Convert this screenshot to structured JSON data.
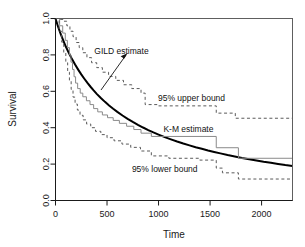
{
  "chart_data": {
    "type": "line",
    "title": "",
    "xlabel": "Time",
    "ylabel": "Survival",
    "xlim": [
      0,
      2300
    ],
    "ylim": [
      0.0,
      1.0
    ],
    "xticks": [
      0,
      500,
      1000,
      1500,
      2000
    ],
    "xticklabels": [
      "0",
      "500",
      "1000",
      "1500",
      "2000"
    ],
    "yticks": [
      0.0,
      0.2,
      0.4,
      0.6,
      0.8,
      1.0
    ],
    "yticklabels": [
      "0.0",
      "0.2",
      "0.4",
      "0.6",
      "0.8",
      "1.0"
    ],
    "grid": false,
    "legend": "none",
    "annotations": [
      {
        "name": "gild-estimate-label",
        "text": "GILD estimate",
        "x": 640,
        "y": 0.805
      },
      {
        "name": "upper-bound-label",
        "text": "95% upper bound",
        "x": 1320,
        "y": 0.545
      },
      {
        "name": "km-estimate-label",
        "text": "K-M estimate",
        "x": 1290,
        "y": 0.375
      },
      {
        "name": "lower-bound-label",
        "text": "95% lower bound",
        "x": 1060,
        "y": 0.155
      }
    ],
    "series": [
      {
        "name": "GILD estimate",
        "style": "solid",
        "color": "#000000",
        "width": 2.0,
        "points": [
          [
            0,
            1.0
          ],
          [
            25,
            0.955
          ],
          [
            50,
            0.915
          ],
          [
            75,
            0.88
          ],
          [
            100,
            0.846
          ],
          [
            130,
            0.81
          ],
          [
            160,
            0.777
          ],
          [
            190,
            0.747
          ],
          [
            220,
            0.719
          ],
          [
            250,
            0.693
          ],
          [
            280,
            0.669
          ],
          [
            310,
            0.646
          ],
          [
            340,
            0.625
          ],
          [
            370,
            0.605
          ],
          [
            400,
            0.586
          ],
          [
            440,
            0.563
          ],
          [
            480,
            0.542
          ],
          [
            520,
            0.522
          ],
          [
            560,
            0.504
          ],
          [
            600,
            0.487
          ],
          [
            650,
            0.467
          ],
          [
            700,
            0.449
          ],
          [
            750,
            0.432
          ],
          [
            800,
            0.416
          ],
          [
            850,
            0.401
          ],
          [
            900,
            0.387
          ],
          [
            950,
            0.374
          ],
          [
            1000,
            0.362
          ],
          [
            1060,
            0.348
          ],
          [
            1120,
            0.336
          ],
          [
            1180,
            0.324
          ],
          [
            1240,
            0.313
          ],
          [
            1300,
            0.303
          ],
          [
            1360,
            0.293
          ],
          [
            1420,
            0.284
          ],
          [
            1480,
            0.275
          ],
          [
            1540,
            0.267
          ],
          [
            1600,
            0.259
          ],
          [
            1670,
            0.25
          ],
          [
            1740,
            0.242
          ],
          [
            1810,
            0.234
          ],
          [
            1880,
            0.227
          ],
          [
            1950,
            0.22
          ],
          [
            2020,
            0.213
          ],
          [
            2090,
            0.207
          ],
          [
            2160,
            0.201
          ],
          [
            2230,
            0.195
          ],
          [
            2300,
            0.19
          ]
        ]
      },
      {
        "name": "K-M estimate",
        "style": "step",
        "color": "#8a8a8a",
        "width": 1.0,
        "points": [
          [
            0,
            1.0
          ],
          [
            40,
            1.0
          ],
          [
            40,
            0.96
          ],
          [
            70,
            0.96
          ],
          [
            70,
            0.92
          ],
          [
            95,
            0.92
          ],
          [
            95,
            0.88
          ],
          [
            115,
            0.88
          ],
          [
            115,
            0.84
          ],
          [
            135,
            0.84
          ],
          [
            135,
            0.8
          ],
          [
            150,
            0.8
          ],
          [
            150,
            0.76
          ],
          [
            165,
            0.76
          ],
          [
            165,
            0.72
          ],
          [
            180,
            0.72
          ],
          [
            180,
            0.68
          ],
          [
            195,
            0.68
          ],
          [
            195,
            0.645
          ],
          [
            215,
            0.645
          ],
          [
            215,
            0.615
          ],
          [
            240,
            0.615
          ],
          [
            240,
            0.59
          ],
          [
            265,
            0.59
          ],
          [
            265,
            0.57
          ],
          [
            300,
            0.57
          ],
          [
            300,
            0.548
          ],
          [
            335,
            0.548
          ],
          [
            335,
            0.527
          ],
          [
            370,
            0.527
          ],
          [
            370,
            0.505
          ],
          [
            410,
            0.505
          ],
          [
            410,
            0.487
          ],
          [
            455,
            0.487
          ],
          [
            455,
            0.47
          ],
          [
            505,
            0.47
          ],
          [
            505,
            0.455
          ],
          [
            560,
            0.455
          ],
          [
            560,
            0.44
          ],
          [
            620,
            0.44
          ],
          [
            620,
            0.424
          ],
          [
            690,
            0.424
          ],
          [
            690,
            0.408
          ],
          [
            760,
            0.408
          ],
          [
            760,
            0.39
          ],
          [
            830,
            0.39
          ],
          [
            830,
            0.37
          ],
          [
            930,
            0.37
          ],
          [
            930,
            0.352
          ],
          [
            1560,
            0.352
          ],
          [
            1560,
            0.29
          ],
          [
            1775,
            0.29
          ],
          [
            1775,
            0.232
          ],
          [
            2300,
            0.232
          ]
        ]
      },
      {
        "name": "95% upper bound",
        "style": "dashed",
        "color": "#5a5a5a",
        "width": 1.0,
        "points": [
          [
            0,
            1.0
          ],
          [
            40,
            1.0
          ],
          [
            40,
            0.995
          ],
          [
            80,
            0.995
          ],
          [
            80,
            0.985
          ],
          [
            110,
            0.985
          ],
          [
            110,
            0.96
          ],
          [
            140,
            0.96
          ],
          [
            140,
            0.93
          ],
          [
            170,
            0.93
          ],
          [
            170,
            0.9
          ],
          [
            200,
            0.9
          ],
          [
            200,
            0.868
          ],
          [
            230,
            0.868
          ],
          [
            230,
            0.84
          ],
          [
            265,
            0.84
          ],
          [
            265,
            0.812
          ],
          [
            305,
            0.812
          ],
          [
            305,
            0.785
          ],
          [
            350,
            0.785
          ],
          [
            350,
            0.757
          ],
          [
            400,
            0.757
          ],
          [
            400,
            0.73
          ],
          [
            455,
            0.73
          ],
          [
            455,
            0.705
          ],
          [
            515,
            0.705
          ],
          [
            515,
            0.682
          ],
          [
            585,
            0.682
          ],
          [
            585,
            0.66
          ],
          [
            660,
            0.66
          ],
          [
            660,
            0.636
          ],
          [
            740,
            0.636
          ],
          [
            740,
            0.615
          ],
          [
            830,
            0.615
          ],
          [
            830,
            0.59
          ],
          [
            870,
            0.59
          ],
          [
            870,
            0.527
          ],
          [
            1000,
            0.527
          ],
          [
            1000,
            0.52
          ],
          [
            1560,
            0.52
          ],
          [
            1560,
            0.48
          ],
          [
            1745,
            0.48
          ],
          [
            1745,
            0.452
          ],
          [
            2300,
            0.452
          ]
        ]
      },
      {
        "name": "95% lower bound",
        "style": "dashed",
        "color": "#5a5a5a",
        "width": 1.0,
        "points": [
          [
            0,
            1.0
          ],
          [
            35,
            1.0
          ],
          [
            35,
            0.93
          ],
          [
            60,
            0.93
          ],
          [
            60,
            0.87
          ],
          [
            80,
            0.87
          ],
          [
            80,
            0.812
          ],
          [
            100,
            0.812
          ],
          [
            100,
            0.757
          ],
          [
            118,
            0.757
          ],
          [
            118,
            0.705
          ],
          [
            135,
            0.705
          ],
          [
            135,
            0.655
          ],
          [
            152,
            0.655
          ],
          [
            152,
            0.61
          ],
          [
            170,
            0.61
          ],
          [
            170,
            0.568
          ],
          [
            190,
            0.568
          ],
          [
            190,
            0.53
          ],
          [
            212,
            0.53
          ],
          [
            212,
            0.497
          ],
          [
            238,
            0.497
          ],
          [
            238,
            0.468
          ],
          [
            268,
            0.468
          ],
          [
            268,
            0.443
          ],
          [
            302,
            0.443
          ],
          [
            302,
            0.42
          ],
          [
            342,
            0.42
          ],
          [
            342,
            0.4
          ],
          [
            388,
            0.4
          ],
          [
            388,
            0.38
          ],
          [
            440,
            0.38
          ],
          [
            440,
            0.362
          ],
          [
            500,
            0.362
          ],
          [
            500,
            0.345
          ],
          [
            568,
            0.345
          ],
          [
            568,
            0.328
          ],
          [
            645,
            0.328
          ],
          [
            645,
            0.31
          ],
          [
            730,
            0.31
          ],
          [
            730,
            0.292
          ],
          [
            825,
            0.292
          ],
          [
            825,
            0.272
          ],
          [
            930,
            0.272
          ],
          [
            930,
            0.245
          ],
          [
            1100,
            0.245
          ],
          [
            1100,
            0.232
          ],
          [
            1400,
            0.232
          ],
          [
            1400,
            0.222
          ],
          [
            1560,
            0.222
          ],
          [
            1560,
            0.178
          ],
          [
            1620,
            0.178
          ],
          [
            1620,
            0.152
          ],
          [
            1775,
            0.152
          ],
          [
            1775,
            0.118
          ],
          [
            2300,
            0.118
          ]
        ]
      }
    ]
  },
  "axis": {
    "ylabel": "Survival",
    "xlabel": "Time"
  }
}
